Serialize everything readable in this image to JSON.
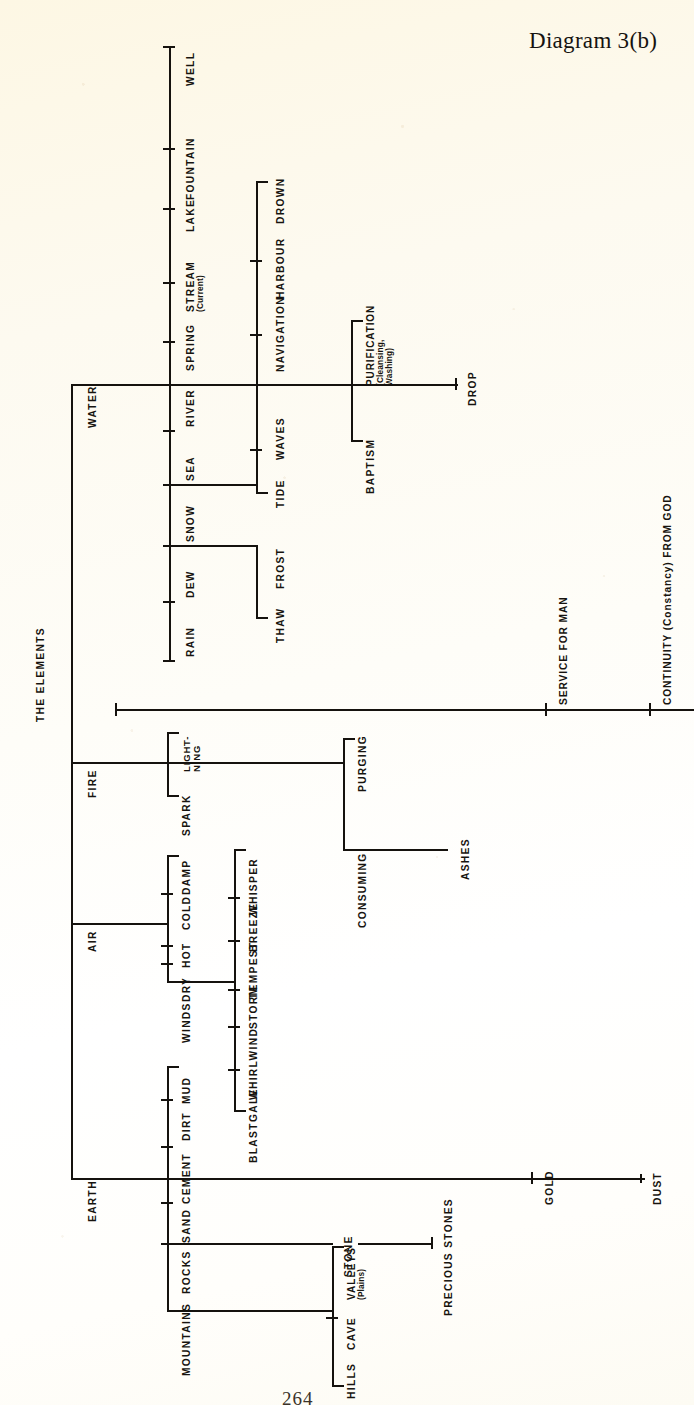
{
  "document": {
    "title": "Diagram 3(b)",
    "page_number": "264",
    "root_label": "THE ELEMENTS",
    "background_color": "#fdf8e9",
    "ink_color": "#15120e"
  },
  "spine": {
    "main_axis_label": "THE ELEMENTS",
    "terminal_labels": [
      {
        "id": "service-for-man",
        "text": "SERVICE FOR MAN"
      },
      {
        "id": "continuity-from-god",
        "text": "CONTINUITY (Constancy) FROM GOD"
      }
    ]
  },
  "elements": [
    {
      "id": "water",
      "name": "WATER",
      "tier1": [
        "RAIN",
        "DEW",
        "SNOW",
        "SEA",
        "RIVER",
        "SPRING",
        "STREAM",
        "LAKE",
        "FOUNTAIN",
        "WELL"
      ],
      "stream_note": "(Current)",
      "tier2_left": [
        "THAW",
        "FROST",
        "TIDE",
        "WAVES"
      ],
      "tier2_right": [
        "NAVIGATION",
        "HARBOUR",
        "DROWN"
      ],
      "bracket_pair": {
        "upper": "PURIFICATION",
        "upper_note_line1": "(Cleansing,",
        "upper_note_line2": "Washing)",
        "lower": "BAPTISM"
      },
      "terminal": "DROP"
    },
    {
      "id": "fire",
      "name": "FIRE",
      "bracket_a": [
        "LIGHT-",
        "NING",
        "SPARK"
      ],
      "bracket_a_labels": [
        "LIGHT-NING",
        "SPARK"
      ],
      "bracket_b": [
        "PURGING",
        "CONSUMING"
      ],
      "terminal": "ASHES"
    },
    {
      "id": "air",
      "name": "AIR",
      "tier1": [
        "WINDS",
        "DRY",
        "HOT",
        "COLD",
        "DAMP"
      ],
      "tier2": [
        "BLAST",
        "GALE",
        "WHIRLWIND",
        "STORM",
        "TEMPEST",
        "BREEZE",
        "WHISPER"
      ]
    },
    {
      "id": "earth",
      "name": "EARTH",
      "tier1": [
        "MOUNTAINS",
        "ROCKS",
        "SAND",
        "CEMENT",
        "DIRT",
        "MUD"
      ],
      "mountains_children": [
        "HILLS",
        "CAVE",
        "VALLEYS"
      ],
      "valleys_note": "(Plains)",
      "rocks_children": [
        "STONE",
        "PRECIOUS STONES"
      ],
      "terminals": [
        "GOLD",
        "DUST"
      ]
    }
  ],
  "labels": {
    "rain": "RAIN",
    "dew": "DEW",
    "snow": "SNOW",
    "sea": "SEA",
    "river": "RIVER",
    "spring": "SPRING",
    "stream": "STREAM",
    "stream_note": "(Current)",
    "lake": "LAKE",
    "fountain": "FOUNTAIN",
    "well": "WELL",
    "thaw": "THAW",
    "frost": "FROST",
    "tide": "TIDE",
    "waves": "WAVES",
    "navigation": "NAVIGATION",
    "harbour": "HARBOUR",
    "drown": "DROWN",
    "purification": "PURIFICATION",
    "purification_note1": "(Cleansing,",
    "purification_note2": "Washing)",
    "baptism": "BAPTISM",
    "drop": "DROP",
    "water": "WATER",
    "fire": "FIRE",
    "air": "AIR",
    "earth": "EARTH",
    "lightning_l1": "LIGHT-",
    "lightning_l2": "NING",
    "spark": "SPARK",
    "purging": "PURGING",
    "consuming": "CONSUMING",
    "ashes": "ASHES",
    "winds": "WINDS",
    "dry": "DRY",
    "hot": "HOT",
    "cold": "COLD",
    "damp": "DAMP",
    "blast": "BLAST",
    "gale": "GALE",
    "whirlwind": "WHIRLWIND",
    "storm": "STORM",
    "tempest": "TEMPEST",
    "breeze": "BREEZE",
    "whisper": "WHISPER",
    "mountains": "MOUNTAINS",
    "rocks": "ROCKS",
    "sand": "SAND",
    "cement": "CEMENT",
    "dirt": "DIRT",
    "mud": "MUD",
    "hills": "HILLS",
    "cave": "CAVE",
    "valleys": "VALLEYS",
    "valleys_note": "(Plains)",
    "stone": "STONE",
    "precious_stones": "PRECIOUS STONES",
    "gold": "GOLD",
    "dust": "DUST",
    "the_elements": "THE ELEMENTS",
    "service_for_man": "SERVICE FOR MAN",
    "continuity": "CONTINUITY (Constancy) FROM GOD"
  }
}
